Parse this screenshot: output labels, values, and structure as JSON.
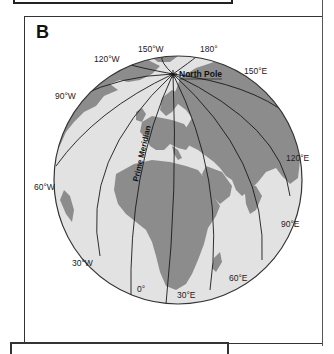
{
  "panel": {
    "letter": "B"
  },
  "globe": {
    "colors": {
      "ocean": "#e2e2e2",
      "land": "#8c8c8c",
      "meridian": "#1a1a1a",
      "outline": "#333333"
    },
    "pole_label": "North Pole",
    "prime_meridian_label": "Prime Meridian",
    "meridian_labels": {
      "w150": "150°W",
      "e180": "180°",
      "w120": "120°W",
      "e150": "150°E",
      "w90": "90°W",
      "e120": "120°E",
      "w60": "60°W",
      "e90": "90°E",
      "w30": "30°W",
      "e60": "60°E",
      "zero": "0°",
      "e30": "30°E"
    }
  }
}
